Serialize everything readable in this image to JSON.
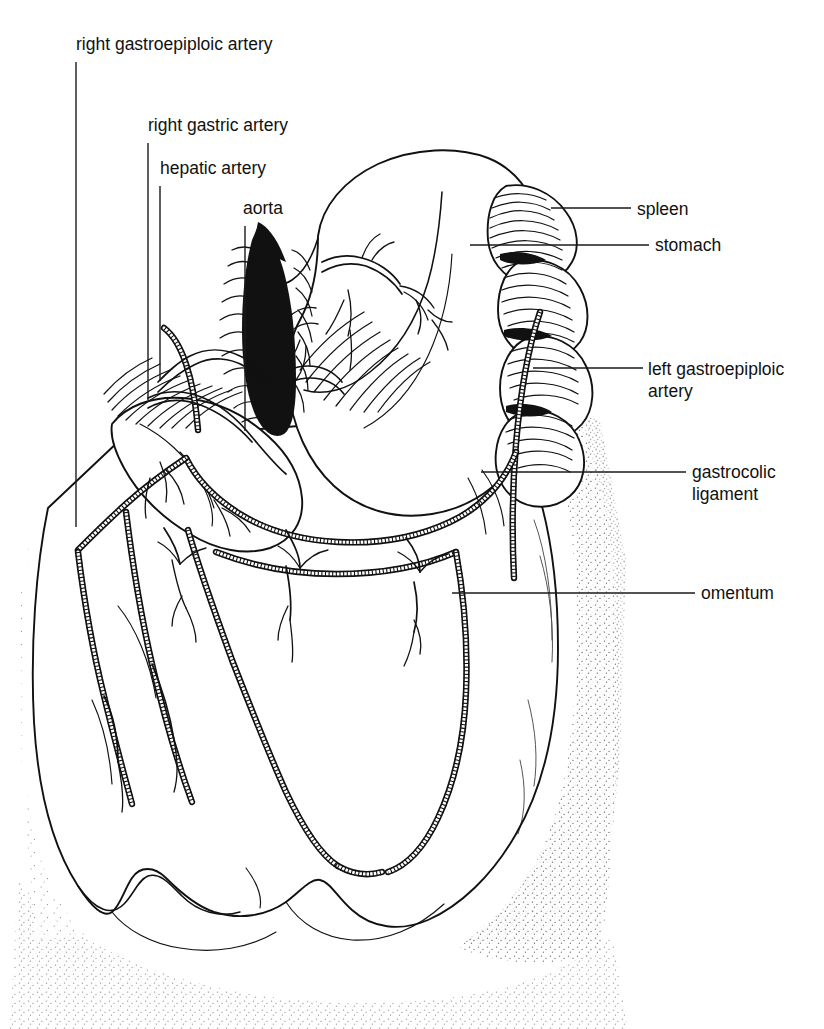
{
  "figure": {
    "kind": "anatomical-line-drawing",
    "background_color": "#ffffff",
    "ink_color": "#111111",
    "width": 824,
    "height": 1029
  },
  "labels": [
    {
      "id": "right-gastroepiploic-artery",
      "text": "right gastroepiploic artery",
      "lines": [
        "right gastroepiploic artery"
      ],
      "text_x": 76,
      "text_y": 50,
      "anchor": "start",
      "leader": {
        "type": "vertical",
        "x": 76,
        "y1": 62,
        "y2": 527
      }
    },
    {
      "id": "right-gastric-artery",
      "text": "right gastric artery",
      "lines": [
        "right gastric artery"
      ],
      "text_x": 148,
      "text_y": 131,
      "anchor": "start",
      "leader": {
        "type": "vertical",
        "x": 148,
        "y1": 143,
        "y2": 400
      }
    },
    {
      "id": "hepatic-artery",
      "text": "hepatic artery",
      "lines": [
        "hepatic artery"
      ],
      "text_x": 160,
      "text_y": 174,
      "anchor": "start",
      "leader": {
        "type": "vertical",
        "x": 160,
        "y1": 186,
        "y2": 381
      }
    },
    {
      "id": "aorta",
      "text": "aorta",
      "lines": [
        "aorta"
      ],
      "text_x": 243,
      "text_y": 214,
      "anchor": "start",
      "leader": {
        "type": "vertical",
        "x": 245,
        "y1": 226,
        "y2": 431
      }
    },
    {
      "id": "spleen",
      "text": "spleen",
      "lines": [
        "spleen"
      ],
      "text_x": 637,
      "text_y": 215,
      "anchor": "start",
      "leader": {
        "type": "horizontal",
        "y": 208,
        "x1": 551,
        "x2": 631
      }
    },
    {
      "id": "stomach",
      "text": "stomach",
      "lines": [
        "stomach"
      ],
      "text_x": 655,
      "text_y": 251,
      "anchor": "start",
      "leader": {
        "type": "horizontal",
        "y": 245,
        "x1": 470,
        "x2": 649
      }
    },
    {
      "id": "left-gastroepiploic-artery",
      "text": "left gastroepiploic artery",
      "lines": [
        "left gastroepiploic",
        "artery"
      ],
      "text_x": 648,
      "text_y": 375,
      "anchor": "start",
      "leader": {
        "type": "horizontal",
        "y": 368,
        "x1": 533,
        "x2": 643
      }
    },
    {
      "id": "gastrocolic-ligament",
      "text": "gastrocolic ligament",
      "lines": [
        "gastrocolic",
        "ligament"
      ],
      "text_x": 692,
      "text_y": 478,
      "anchor": "start",
      "leader": {
        "type": "horizontal",
        "y": 472,
        "x1": 481,
        "x2": 686
      }
    },
    {
      "id": "omentum",
      "text": "omentum",
      "lines": [
        "omentum"
      ],
      "text_x": 701,
      "text_y": 599,
      "anchor": "start",
      "leader": {
        "type": "horizontal",
        "y": 593,
        "x1": 452,
        "x2": 695
      }
    }
  ],
  "structures": [
    {
      "id": "stomach",
      "name": "stomach"
    },
    {
      "id": "spleen",
      "name": "spleen"
    },
    {
      "id": "aorta",
      "name": "aorta"
    },
    {
      "id": "omentum",
      "name": "omentum"
    },
    {
      "id": "gastrocolic-ligament",
      "name": "gastrocolic ligament"
    },
    {
      "id": "right-gastroepiploic-artery",
      "name": "right gastroepiploic artery"
    },
    {
      "id": "left-gastroepiploic-artery",
      "name": "left gastroepiploic artery"
    },
    {
      "id": "right-gastric-artery",
      "name": "right gastric artery"
    },
    {
      "id": "hepatic-artery",
      "name": "hepatic artery"
    }
  ]
}
